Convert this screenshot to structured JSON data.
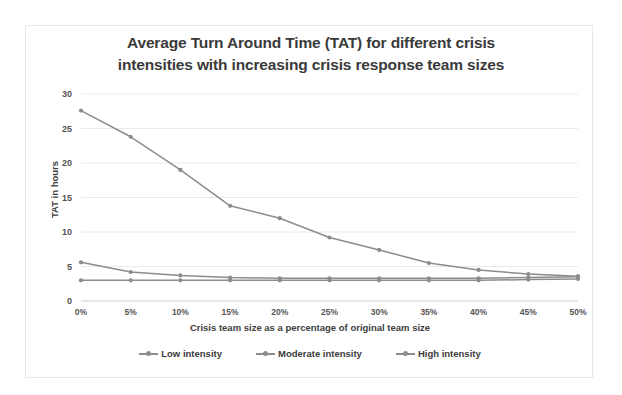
{
  "chart_data": {
    "type": "line",
    "title": "Average Turn Around Time (TAT) for different crisis intensities with increasing crisis response team sizes",
    "title_line1": "Average Turn Around Time (TAT) for different crisis",
    "title_line2": "intensities with increasing crisis response team sizes",
    "xlabel": "Crisis team size as a percentage of original team size",
    "ylabel": "TAT in hours",
    "categories": [
      "0%",
      "5%",
      "10%",
      "15%",
      "20%",
      "25%",
      "30%",
      "35%",
      "40%",
      "45%",
      "50%"
    ],
    "x": [
      0,
      5,
      10,
      15,
      20,
      25,
      30,
      35,
      40,
      45,
      50
    ],
    "ylim": [
      0,
      30
    ],
    "yticks": [
      0,
      5,
      10,
      15,
      20,
      25,
      30
    ],
    "grid": true,
    "legend_position": "bottom",
    "series": [
      {
        "name": "Low intensity",
        "color": "#8c8c8c",
        "values": [
          3.0,
          3.0,
          3.0,
          3.0,
          3.0,
          3.0,
          3.0,
          3.0,
          3.0,
          3.1,
          3.2
        ]
      },
      {
        "name": "Moderate intensity",
        "color": "#8c8c8c",
        "values": [
          5.6,
          4.2,
          3.7,
          3.4,
          3.3,
          3.3,
          3.3,
          3.3,
          3.3,
          3.4,
          3.5
        ]
      },
      {
        "name": "High intensity",
        "color": "#8c8c8c",
        "values": [
          27.6,
          23.8,
          19.0,
          13.8,
          12.0,
          9.2,
          7.4,
          5.5,
          4.5,
          3.9,
          3.6
        ]
      }
    ]
  },
  "legend": {
    "items": [
      {
        "label": "Low intensity"
      },
      {
        "label": "Moderate intensity"
      },
      {
        "label": "High intensity"
      }
    ]
  }
}
